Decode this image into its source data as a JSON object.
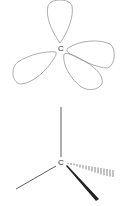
{
  "diagrams": [
    {
      "name": "sp3-orbitals",
      "center_label": "C",
      "lobes": 4,
      "stroke_color": "#888888"
    },
    {
      "name": "tetrahedral-wedge-dash",
      "center_label": "C",
      "bonds": [
        "plain-up",
        "plain-left",
        "hashed-wedge-right",
        "solid-wedge-down-right"
      ],
      "stroke_color": "#222222"
    }
  ]
}
